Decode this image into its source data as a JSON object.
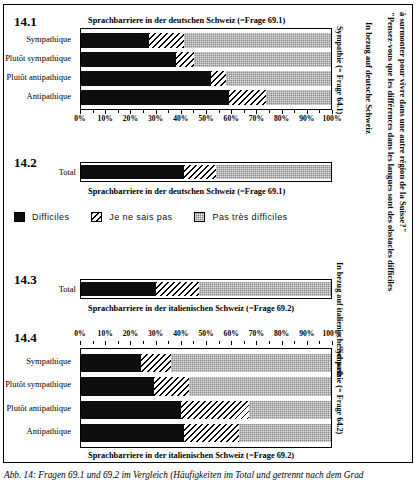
{
  "figure": {
    "caption": "Abb. 14: Fragen 69.1 und 69.2 im Vergleich (Häufigkeiten im Total und getrennt nach dem Grad",
    "quote_right": "\"Pensez-vous que les différences dans les langues sont des obstacles difficiles",
    "quote_right2": "à surmonter pour vivre dans une autre région de la Suisse?\"",
    "region_label_german": "In bezug auf deutsche Schweiz",
    "region_label_italian": "In bezug auf italienische Schweiz"
  },
  "legend": {
    "items": [
      {
        "label": "Difficiles",
        "swatch": "solid-black",
        "color": "#0d0d0d"
      },
      {
        "label": "Je ne sais pas",
        "swatch": "diagonal-hatch",
        "color": "#ffffff"
      },
      {
        "label": "Pas très difficiles",
        "swatch": "gray-checker",
        "color": "#8a8a8a"
      }
    ]
  },
  "axis": {
    "ticklabels": [
      "0%",
      "10%",
      "20%",
      "30%",
      "40%",
      "50%",
      "60%",
      "70%",
      "80%",
      "90%",
      "100%"
    ],
    "min": 0,
    "max": 100
  },
  "sections": {
    "s141": {
      "number": "14.1",
      "title": "Sprachbarriere in der deutschen Schweiz (=Frage 69.1)",
      "side_label": "Sympathie (= Frage 64.1)"
    },
    "s142": {
      "number": "14.2",
      "title": "Sprachbarriere in der deutschen Schweiz (=Frage 69.1)",
      "row_label": "Total"
    },
    "s143": {
      "number": "14.3",
      "title": "Sprachbarriere in der italienischen Schweiz (=Frage 69.2)",
      "row_label": "Total"
    },
    "s144": {
      "number": "14.4",
      "title": "Sprachbarriere in der italienischen Schweiz (=Frage 69.2)",
      "side_label": "Sympathie (= Frage 64.2)"
    }
  },
  "chart_data": [
    {
      "id": "14.1",
      "type": "bar",
      "orientation": "horizontal",
      "stacked": true,
      "percent": true,
      "title": "Sprachbarriere in der deutschen Schweiz (=Frage 69.1)",
      "xlabel": "",
      "ylabel": "",
      "xlim": [
        0,
        100
      ],
      "grid": false,
      "legend_position": "below-figure",
      "categories": [
        "Sympathique",
        "Plutôt sympathique",
        "Plutôt antipathique",
        "Antipathique"
      ],
      "series": [
        {
          "name": "Difficiles",
          "values": [
            27,
            38,
            52,
            59
          ]
        },
        {
          "name": "Je ne sais pas",
          "values": [
            14,
            7,
            6,
            15
          ]
        },
        {
          "name": "Pas très difficiles",
          "values": [
            59,
            55,
            42,
            26
          ]
        }
      ]
    },
    {
      "id": "14.2",
      "type": "bar",
      "orientation": "horizontal",
      "stacked": true,
      "percent": true,
      "title": "Sprachbarriere in der deutschen Schweiz (=Frage 69.1)",
      "xlim": [
        0,
        100
      ],
      "grid": false,
      "categories": [
        "Total"
      ],
      "series": [
        {
          "name": "Difficiles",
          "values": [
            41
          ]
        },
        {
          "name": "Je ne sais pas",
          "values": [
            13
          ]
        },
        {
          "name": "Pas très difficiles",
          "values": [
            46
          ]
        }
      ]
    },
    {
      "id": "14.3",
      "type": "bar",
      "orientation": "horizontal",
      "stacked": true,
      "percent": true,
      "title": "Sprachbarriere in der italienischen Schweiz (=Frage 69.2)",
      "xlim": [
        0,
        100
      ],
      "grid": false,
      "categories": [
        "Total"
      ],
      "series": [
        {
          "name": "Difficiles",
          "values": [
            30
          ]
        },
        {
          "name": "Je ne sais pas",
          "values": [
            17
          ]
        },
        {
          "name": "Pas très difficiles",
          "values": [
            53
          ]
        }
      ]
    },
    {
      "id": "14.4",
      "type": "bar",
      "orientation": "horizontal",
      "stacked": true,
      "percent": true,
      "title": "Sprachbarriere in der italienischen Schweiz (=Frage 69.2)",
      "xlim": [
        0,
        100
      ],
      "grid": false,
      "categories": [
        "Sympathique",
        "Plutôt sympathique",
        "Plutôt antipathique",
        "Antipathique"
      ],
      "series": [
        {
          "name": "Difficiles",
          "values": [
            24,
            29,
            40,
            41
          ]
        },
        {
          "name": "Je ne sais pas",
          "values": [
            12,
            14,
            27,
            22
          ]
        },
        {
          "name": "Pas très difficiles",
          "values": [
            64,
            57,
            33,
            37
          ]
        }
      ]
    }
  ]
}
